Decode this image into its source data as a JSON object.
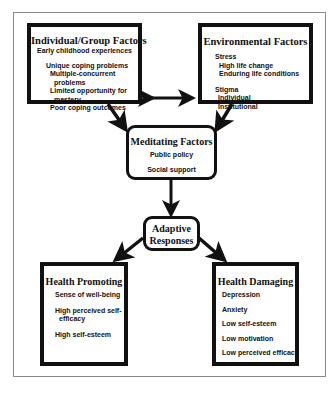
{
  "diagram": {
    "individual_group": {
      "title": "Individual/Group Factors",
      "items": [
        "Early childhood experiences",
        "Unique coping problems",
        "Multiple-concurrent",
        "problems",
        "Limited opportunity for",
        "mastery",
        "Poor coping outcomes"
      ]
    },
    "environmental": {
      "title": "Environmental Factors",
      "items": [
        "Stress",
        "High life change",
        "Enduring life conditions",
        "Stigma",
        "Individual",
        "Institutional"
      ]
    },
    "meditating": {
      "title": "Meditating Factors",
      "items": [
        "Public policy",
        "Social support"
      ]
    },
    "adaptive": {
      "title_line1": "Adaptive",
      "title_line2": "Responses"
    },
    "health_promoting": {
      "title": "Health Promoting",
      "items": [
        "Sense of well-being",
        "High perceived self-",
        "efficacy",
        "High self-esteem"
      ]
    },
    "health_damaging": {
      "title": "Health Damaging",
      "items": [
        "Depression",
        "Anxiety",
        "Low self-esteem",
        "Low motivation",
        "Low perceived efficacy"
      ]
    },
    "colors": {
      "line": "#111111",
      "frame": "#8a8a8a",
      "background": "#ffffff"
    }
  }
}
